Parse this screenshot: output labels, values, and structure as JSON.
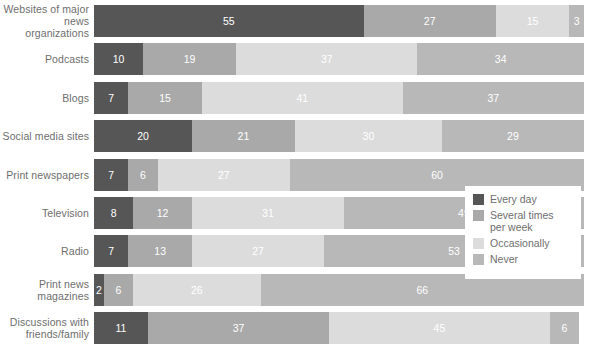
{
  "chart_data": {
    "type": "bar",
    "title": "",
    "subtitle": "",
    "xlabel": "",
    "ylabel": "",
    "orientation": "horizontal",
    "stacked": true,
    "grid": false,
    "xlim": [
      0,
      100
    ],
    "legend_position": "inside-right",
    "categories": [
      "Websites of major\nnews organizations",
      "Podcasts",
      "Blogs",
      "Social media sites",
      "Print newspapers",
      "Television",
      "Radio",
      "Print news\nmagazines",
      "Discussions with\nfriends/family"
    ],
    "series": [
      {
        "name": "Every day",
        "color": "#565656",
        "values": [
          55,
          10,
          7,
          20,
          7,
          8,
          7,
          2,
          11
        ]
      },
      {
        "name": "Several times\nper week",
        "color": "#a9a9a9",
        "values": [
          27,
          19,
          15,
          21,
          6,
          12,
          13,
          6,
          37
        ]
      },
      {
        "name": "Occasionally",
        "color": "#dcdcdc",
        "values": [
          15,
          37,
          41,
          30,
          27,
          31,
          27,
          26,
          45
        ]
      },
      {
        "name": "Never",
        "color": "#b8b8b8",
        "values": [
          3,
          34,
          37,
          29,
          60,
          49,
          53,
          66,
          6
        ]
      }
    ]
  },
  "legend": {
    "items": [
      {
        "label": "Every day",
        "color": "#565656"
      },
      {
        "label": "Several times\nper week",
        "color": "#a9a9a9"
      },
      {
        "label": "Occasionally",
        "color": "#dcdcdc"
      },
      {
        "label": "Never",
        "color": "#b8b8b8"
      }
    ]
  }
}
